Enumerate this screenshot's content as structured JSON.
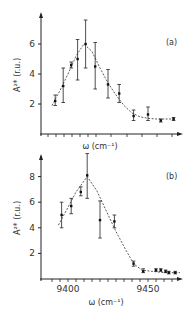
{
  "chart_data": [
    {
      "type": "scatter",
      "panel_label": "(a)",
      "title": "",
      "xlabel": "ω (cm⁻¹)",
      "ylabel": "A²* (r.u.)",
      "yticks": [
        2,
        4,
        6
      ],
      "xticks": [],
      "xlim": [
        9387,
        9478
      ],
      "ylim": [
        0,
        7.5
      ],
      "grid": false,
      "fit_curve": "dashed",
      "series": [
        {
          "name": "data",
          "x": [
            9392,
            9397,
            9402,
            9406,
            9411,
            9417,
            9425,
            9432,
            9441,
            9450,
            9458,
            9466
          ],
          "y": [
            2.2,
            3.2,
            4.6,
            5.0,
            6.0,
            4.5,
            3.3,
            2.7,
            1.2,
            1.3,
            0.9,
            1.0
          ],
          "err_low": [
            1.9,
            2.1,
            4.4,
            3.6,
            4.4,
            3.0,
            2.4,
            2.1,
            0.9,
            0.9,
            0.8,
            0.9
          ],
          "err_high": [
            2.6,
            4.4,
            4.8,
            6.3,
            7.6,
            6.1,
            4.3,
            3.3,
            1.6,
            1.8,
            1.0,
            1.1
          ]
        },
        {
          "name": "fit",
          "x": [
            9390,
            9395,
            9400,
            9405,
            9410,
            9415,
            9420,
            9425,
            9430,
            9435,
            9440,
            9445,
            9450,
            9455,
            9460,
            9466
          ],
          "y": [
            1.9,
            2.9,
            4.0,
            5.2,
            6.0,
            5.5,
            4.4,
            3.4,
            2.6,
            1.9,
            1.4,
            1.15,
            1.05,
            1.0,
            1.0,
            1.0
          ]
        }
      ]
    },
    {
      "type": "scatter",
      "panel_label": "(b)",
      "title": "",
      "xlabel": "ω (cm⁻¹)",
      "ylabel": "A²* (r.u.)",
      "yticks": [
        2,
        4,
        6,
        8
      ],
      "xticks": [
        9400,
        9450
      ],
      "xlim": [
        9383,
        9478
      ],
      "ylim": [
        0,
        9.5
      ],
      "grid": false,
      "fit_curve": "dashed",
      "series": [
        {
          "name": "data",
          "x": [
            9396,
            9402,
            9408,
            9412,
            9420,
            9429,
            9441,
            9447,
            9455,
            9458,
            9461,
            9463,
            9467
          ],
          "y": [
            5.0,
            5.7,
            6.8,
            8.1,
            4.6,
            4.5,
            1.2,
            0.6,
            0.7,
            0.7,
            0.6,
            0.5,
            0.5
          ],
          "err_low": [
            4.0,
            5.1,
            6.5,
            6.3,
            3.2,
            4.0,
            1.0,
            0.5,
            0.6,
            0.6,
            0.5,
            0.4,
            0.4
          ],
          "err_high": [
            6.0,
            6.3,
            7.2,
            9.8,
            6.1,
            5.0,
            1.4,
            0.8,
            0.8,
            0.8,
            0.7,
            0.6,
            0.6
          ]
        },
        {
          "name": "fit",
          "x": [
            9394,
            9400,
            9405,
            9412,
            9418,
            9424,
            9430,
            9436,
            9441,
            9446,
            9452,
            9460,
            9470
          ],
          "y": [
            4.2,
            5.6,
            6.8,
            8.0,
            6.9,
            5.3,
            3.7,
            2.3,
            1.2,
            0.7,
            0.6,
            0.5,
            0.5
          ]
        }
      ]
    }
  ]
}
